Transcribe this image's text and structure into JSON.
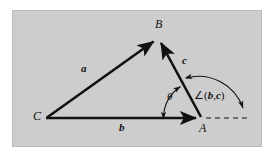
{
  "figure": {
    "kind": "vector-triangle-diagram",
    "background_color": "#cdcdcd",
    "page_color": "#ffffff",
    "ink_color": "#111111",
    "vertices": [
      {
        "name": "B",
        "label": "B",
        "x": 158,
        "y": 38
      },
      {
        "name": "C",
        "label": "C",
        "x": 46,
        "y": 118
      },
      {
        "name": "A",
        "label": "A",
        "x": 201,
        "y": 118
      }
    ],
    "vectors": [
      {
        "name": "a",
        "label": "a",
        "from": "C",
        "to": "B"
      },
      {
        "name": "b",
        "label": "b",
        "from": "C",
        "to": "A"
      },
      {
        "name": "c",
        "label": "c",
        "from": "A",
        "to": "B"
      }
    ],
    "angles": [
      {
        "name": "theta",
        "label": "θ",
        "description": "interior angle at A between b and c"
      },
      {
        "name": "angle-b-c",
        "label": "∠(b,c)",
        "prefix": "∠(",
        "first": "b",
        "separator": ",",
        "second": "c",
        "suffix": ")"
      }
    ],
    "dashed_ray": {
      "name": "extension-of-b",
      "from_x": 205,
      "to_x": 250,
      "y": 118
    }
  }
}
